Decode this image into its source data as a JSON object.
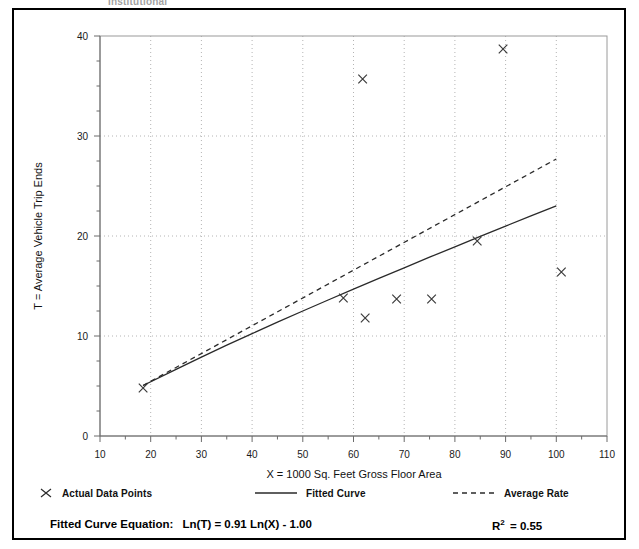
{
  "figure": {
    "ghost_title": "Institutional",
    "xlabel": "X = 1000 Sq. Feet Gross Floor Area",
    "ylabel": "T = Average Vehicle Trip Ends",
    "equation_prefix": "Fitted Curve Equation:",
    "equation_body": "Ln(T) = 0.91 Ln(X) - 1.00",
    "r2_label": "R",
    "r2_sup": "2",
    "r2_value": "= 0.55"
  },
  "legend": {
    "items": [
      {
        "label": "Actual Data Points",
        "glyph": "x-marker-icon"
      },
      {
        "label": "Fitted Curve",
        "glyph": "solid-line-icon"
      },
      {
        "label": "Average Rate",
        "glyph": "dashed-line-icon"
      }
    ]
  },
  "chart_data": {
    "type": "scatter",
    "title": "",
    "xlabel": "X = 1000 Sq. Feet Gross Floor Area",
    "ylabel": "T = Average Vehicle Trip Ends",
    "xlim": [
      10,
      110
    ],
    "ylim": [
      0,
      40
    ],
    "xticks": [
      10,
      20,
      30,
      40,
      50,
      60,
      70,
      80,
      90,
      100,
      110
    ],
    "yticks": [
      0,
      10,
      20,
      30,
      40
    ],
    "x_minor_step": 5,
    "y_minor_step": 2.5,
    "grid": true,
    "grid_style": "dotted",
    "legend_position": "below-plot",
    "points": [
      {
        "x": 18.5,
        "y": 4.8
      },
      {
        "x": 58.0,
        "y": 13.8
      },
      {
        "x": 61.8,
        "y": 35.7
      },
      {
        "x": 62.3,
        "y": 11.8
      },
      {
        "x": 68.5,
        "y": 13.7
      },
      {
        "x": 75.4,
        "y": 13.7
      },
      {
        "x": 84.4,
        "y": 19.5
      },
      {
        "x": 89.5,
        "y": 38.7
      },
      {
        "x": 101.0,
        "y": 16.4
      }
    ],
    "series": [
      {
        "name": "Fitted Curve",
        "type": "line",
        "style": "solid",
        "equation": "Ln(T) = 0.91 Ln(X) - 1.00",
        "x": [
          18.5,
          25,
          30,
          35,
          40,
          45,
          50,
          55,
          60,
          65,
          70,
          75,
          80,
          85,
          90,
          95,
          100
        ],
        "y": [
          5.05,
          6.67,
          7.89,
          9.08,
          10.24,
          11.38,
          12.5,
          13.6,
          14.69,
          15.76,
          16.82,
          17.88,
          18.92,
          19.96,
          20.99,
          22.01,
          23.02
        ]
      },
      {
        "name": "Average Rate",
        "type": "line",
        "style": "dashed",
        "x": [
          18.5,
          100
        ],
        "y": [
          5.05,
          27.7
        ]
      }
    ],
    "annotations": {
      "r_squared": 0.55,
      "fitted_equation": "Ln(T) = 0.91 Ln(X) - 1.00"
    }
  }
}
